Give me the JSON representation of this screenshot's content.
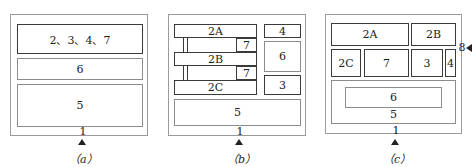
{
  "panels": {
    "a": {
      "caption": "（a）",
      "frame_label": "1",
      "boxes": {
        "top": "2、3、4、7",
        "middle": "6",
        "bottom": "5"
      }
    },
    "b": {
      "caption": "（b）",
      "frame_label": "1",
      "boxes": {
        "b2a": "2A",
        "b2b": "2B",
        "b2c": "2C",
        "b7_upper": "7",
        "b7_lower": "7",
        "b4": "4",
        "b6": "6",
        "b3": "3",
        "b5": "5"
      }
    },
    "c": {
      "caption": "（c）",
      "frame_label": "1",
      "side_label": "8",
      "boxes": {
        "c2a": "2A",
        "c2b": "2B",
        "c2c": "2C",
        "c7": "7",
        "c3": "3",
        "c4": "4",
        "c6": "6",
        "c5": "5"
      }
    }
  }
}
